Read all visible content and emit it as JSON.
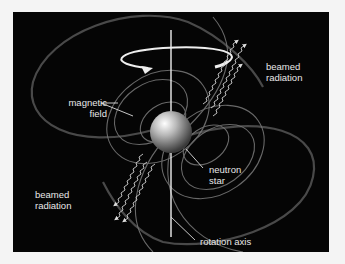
{
  "diagram": {
    "labels": {
      "magnetic_field_line1": "magnetic",
      "magnetic_field_line2": "field",
      "beamed_radiation_top_line1": "beamed",
      "beamed_radiation_top_line2": "radiation",
      "beamed_radiation_bottom_line1": "beamed",
      "beamed_radiation_bottom_line2": "radiation",
      "neutron_star_line1": "neutron",
      "neutron_star_line2": "star",
      "rotation_axis": "rotation axis"
    },
    "colors": {
      "background": "#050505",
      "page": "#f4f4f4",
      "label_text": "#e8e8e8",
      "field_lines": "#8a8a8a",
      "star": "#b0b0b0"
    },
    "icons": [
      "rotation-arrow-icon",
      "wavy-radiation-arrow-icon"
    ]
  }
}
